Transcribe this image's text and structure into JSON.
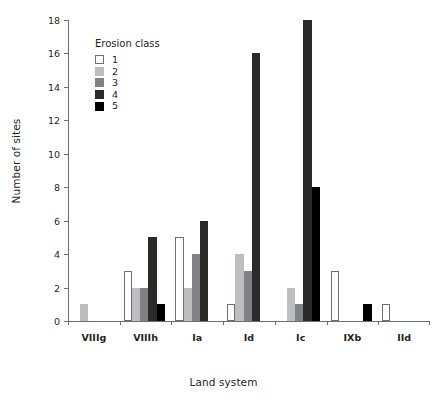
{
  "chart_data": {
    "type": "bar",
    "title": "",
    "xlabel": "Land system",
    "ylabel": "Number of sites",
    "categories": [
      "VIIIg",
      "VIIIh",
      "Ia",
      "Id",
      "Ic",
      "IXb",
      "IId"
    ],
    "ylim": [
      0,
      18
    ],
    "yticks": [
      0,
      2,
      4,
      6,
      8,
      10,
      12,
      14,
      16,
      18
    ],
    "grid": false,
    "legend_title": "Erosion class",
    "legend_position": "upper-left-inside",
    "series": [
      {
        "name": "1",
        "color": "#ffffff",
        "border": "#6d6e71",
        "values": [
          0,
          3,
          5,
          1,
          0,
          3,
          1
        ]
      },
      {
        "name": "2",
        "color": "#bcbec0",
        "border": "#bcbec0",
        "values": [
          1,
          2,
          2,
          4,
          2,
          0,
          0
        ]
      },
      {
        "name": "3",
        "color": "#808285",
        "border": "#808285",
        "values": [
          0,
          2,
          4,
          3,
          1,
          0,
          0
        ]
      },
      {
        "name": "4",
        "color": "#2b2a29",
        "border": "#2b2a29",
        "values": [
          0,
          5,
          6,
          16,
          18,
          0,
          0
        ]
      },
      {
        "name": "5",
        "color": "#000000",
        "border": "#000000",
        "values": [
          0,
          1,
          0,
          0,
          8,
          1,
          0
        ]
      }
    ]
  },
  "axis": {
    "y_title": "Number of sites",
    "x_title": "Land system"
  }
}
